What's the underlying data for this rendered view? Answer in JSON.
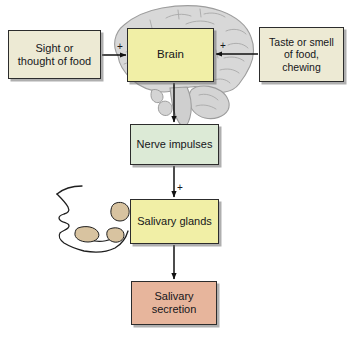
{
  "diagram": {
    "type": "flowchart",
    "nodes": [
      {
        "id": "sight",
        "label": "Sight or\nthought of food",
        "color": "#edead4",
        "shape": "rectangle"
      },
      {
        "id": "brain",
        "label": "Brain",
        "color": "#f1efa6",
        "shape": "rectangle"
      },
      {
        "id": "taste",
        "label": "Taste or smell\nof food,\nchewing",
        "color": "#edead4",
        "shape": "rectangle"
      },
      {
        "id": "nerve",
        "label": "Nerve impulses",
        "color": "#dcead6",
        "shape": "rectangle"
      },
      {
        "id": "glands",
        "label": "Salivary glands",
        "color": "#f1efa6",
        "shape": "rectangle"
      },
      {
        "id": "secretion",
        "label": "Salivary\nsecretion",
        "color": "#e7b59c",
        "shape": "rectangle"
      }
    ],
    "edges": [
      {
        "from": "sight",
        "to": "brain",
        "sign": "+",
        "direction": "right"
      },
      {
        "from": "taste",
        "to": "brain",
        "sign": "+",
        "direction": "left"
      },
      {
        "from": "brain",
        "to": "nerve",
        "sign": "",
        "direction": "down"
      },
      {
        "from": "nerve",
        "to": "glands",
        "sign": "+",
        "direction": "down"
      },
      {
        "from": "glands",
        "to": "secretion",
        "sign": "",
        "direction": "down"
      }
    ],
    "signs": {
      "left_stimulus": "+",
      "right_stimulus": "+",
      "gland_stimulus": "+"
    },
    "illustrations": [
      {
        "id": "brain-anatomy",
        "name": "brain-sagittal-illustration",
        "fill": "#d9d9d9",
        "stroke": "#9a9a9a"
      },
      {
        "id": "head-profile",
        "name": "head-profile-with-salivary-glands-illustration",
        "fill": "#d8c3a0",
        "stroke": "#2c2c2c"
      }
    ],
    "colors": {
      "stimulus_box": "#edead4",
      "brain_box": "#f1efa6",
      "nerve_box": "#dcead6",
      "gland_box": "#f1efa6",
      "secretion_box": "#e7b59c",
      "outline": "#2c2c2c",
      "arrow": "#111111",
      "background": "#ffffff"
    }
  }
}
